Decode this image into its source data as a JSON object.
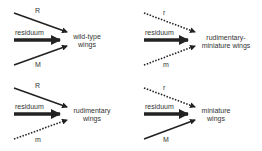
{
  "panels": [
    {
      "id": "wild-type",
      "top_label": "R",
      "top_style": "solid",
      "middle_label": "residuum",
      "bottom_label": "M",
      "bottom_style": "solid",
      "outcome_line1": "wild-type",
      "outcome_line2": "wings"
    },
    {
      "id": "rudimentary-miniature",
      "top_label": "r",
      "top_style": "dotted",
      "middle_label": "residuum",
      "bottom_label": "m",
      "bottom_style": "dotted",
      "outcome_line1": "rudimentary-",
      "outcome_line2": "miniature wings"
    },
    {
      "id": "rudimentary",
      "top_label": "R",
      "top_style": "solid",
      "middle_label": "residuum",
      "bottom_label": "m",
      "bottom_style": "dotted",
      "outcome_line1": "rudimentary",
      "outcome_line2": "wings"
    },
    {
      "id": "miniature",
      "top_label": "r",
      "top_style": "dotted",
      "middle_label": "residuum",
      "bottom_label": "M",
      "bottom_style": "solid",
      "outcome_line1": "miniature",
      "outcome_line2": "wings"
    }
  ],
  "colors": {
    "arrow": "#222222",
    "text": "#333333",
    "background": "#ffffff"
  }
}
